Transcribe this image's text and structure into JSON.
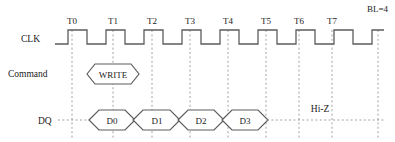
{
  "diagram": {
    "corner_label": "BL=4",
    "title_hidden": "",
    "signals": [
      {
        "name": "clk",
        "label": "CLK"
      },
      {
        "name": "command",
        "label": "Command"
      },
      {
        "name": "dq",
        "label": "DQ"
      }
    ],
    "ticks": [
      {
        "label": "T0",
        "x": 72
      },
      {
        "label": "T1",
        "x": 113
      },
      {
        "label": "T2",
        "x": 152
      },
      {
        "label": "T3",
        "x": 190
      },
      {
        "label": "T4",
        "x": 228
      },
      {
        "label": "T5",
        "x": 266
      },
      {
        "label": "T6",
        "x": 299
      },
      {
        "label": "T7",
        "x": 332
      }
    ],
    "command_cells": [
      {
        "label": "WRITE",
        "center": 113,
        "half_width": 26
      }
    ],
    "dq_cells": [
      {
        "label": "D0",
        "center": 112,
        "half_width": 24
      },
      {
        "label": "D1",
        "center": 157,
        "half_width": 24
      },
      {
        "label": "D2",
        "center": 201,
        "half_width": 24
      },
      {
        "label": "D3",
        "center": 245,
        "half_width": 24
      }
    ],
    "hiz": {
      "label": "Hi-Z",
      "x": 320,
      "y": 112
    },
    "clock": {
      "period": 38,
      "high_level_y": 30,
      "low_level_y": 44,
      "first_rise_x": 68,
      "duty_high": 19,
      "start_x": 55,
      "end_x": 384,
      "cycles": 8
    },
    "colors": {
      "stroke": "#5c5c5c",
      "grid": "#8a8a8a",
      "text": "#1a1a1a",
      "background": "#ffffff"
    }
  }
}
